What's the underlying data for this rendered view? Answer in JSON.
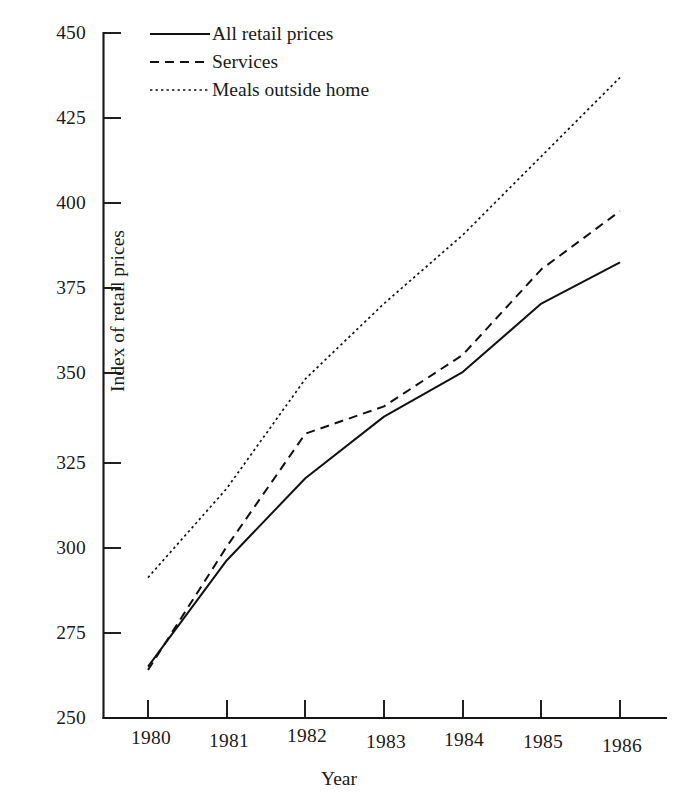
{
  "chart_data": {
    "type": "line",
    "title": "",
    "xlabel": "Year",
    "ylabel": "Index of retail prices",
    "categories": [
      "1980",
      "1981",
      "1982",
      "1983",
      "1984",
      "1985",
      "1986"
    ],
    "x": [
      1980,
      1981,
      1982,
      1983,
      1984,
      1985,
      1986
    ],
    "xlim": [
      1980,
      1986
    ],
    "ylim": [
      250,
      450
    ],
    "y_ticks": [
      250,
      275,
      300,
      325,
      350,
      375,
      400,
      425,
      450
    ],
    "x_ticks": [
      "1980",
      "1981",
      "1982",
      "1983",
      "1984",
      "1985",
      "1986"
    ],
    "grid": false,
    "legend_position": "top-left",
    "series": [
      {
        "name": "All retail prices",
        "style": "solid",
        "color": "#111111",
        "values": [
          265,
          296,
          320,
          338,
          351,
          371,
          383
        ]
      },
      {
        "name": "Services",
        "style": "dashed",
        "color": "#111111",
        "values": [
          264,
          300,
          333,
          341,
          356,
          381,
          398
        ]
      },
      {
        "name": "Meals outside home",
        "style": "dotted",
        "color": "#111111",
        "values": [
          291,
          317,
          349,
          371,
          391,
          414,
          437
        ]
      }
    ]
  },
  "axes": {
    "y_tick_labels": [
      "450",
      "425",
      "400",
      "375",
      "350",
      "325",
      "300",
      "275",
      "250"
    ],
    "x_tick_labels": [
      "1980",
      "1981",
      "1982",
      "1983",
      "1984",
      "1985",
      "1986"
    ],
    "y_axis_title": "Index of retail prices",
    "x_axis_title": "Year"
  },
  "legend": {
    "items": [
      {
        "label": "All retail prices",
        "style": "solid"
      },
      {
        "label": "Services",
        "style": "dashed"
      },
      {
        "label": "Meals outside home",
        "style": "dotted"
      }
    ]
  }
}
